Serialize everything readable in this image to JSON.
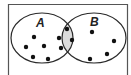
{
  "diagram": {
    "type": "venn",
    "sets": [
      {
        "label": "A",
        "only_count": 5
      },
      {
        "label": "B",
        "only_count": 4
      }
    ],
    "intersection_count": 4,
    "colors": {
      "outline": "#2a2a2a",
      "intersection_fill": "#dcdcdc",
      "dot": "#111111",
      "background": "#ffffff",
      "frame": "#555555"
    }
  }
}
